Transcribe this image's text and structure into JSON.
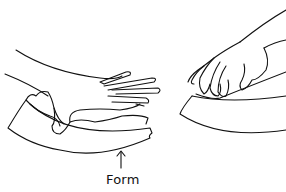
{
  "illustration": {
    "label": "Form",
    "stroke_color": "#111111",
    "background": "#ffffff",
    "panels": [
      {
        "name": "left",
        "description": "hand pressing material over form"
      },
      {
        "name": "right",
        "description": "hand gripping edge of material over form"
      }
    ]
  }
}
